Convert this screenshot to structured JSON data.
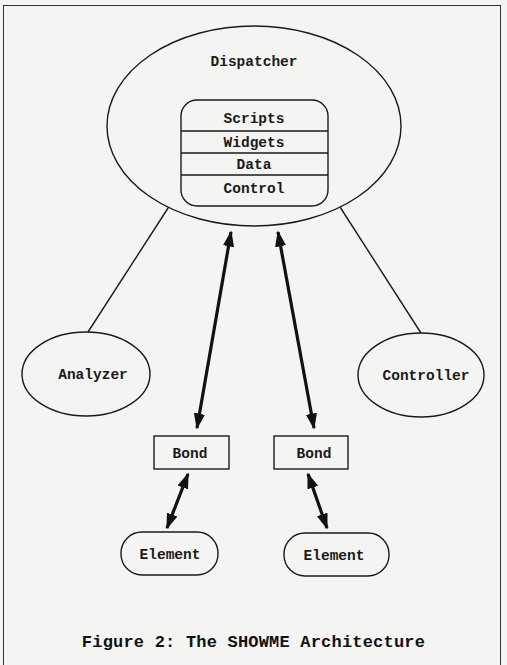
{
  "figure": {
    "caption": "Figure 2: The SHOWME Architecture"
  },
  "nodes": {
    "dispatcher": {
      "label": "Dispatcher",
      "shape": "ellipse"
    },
    "dispatcher_stack": {
      "layers": [
        "Scripts",
        "Widgets",
        "Data",
        "Control"
      ]
    },
    "analyzer": {
      "label": "Analyzer",
      "shape": "ellipse"
    },
    "controller": {
      "label": "Controller",
      "shape": "ellipse"
    },
    "bond_left": {
      "label": "Bond",
      "shape": "rectangle"
    },
    "bond_right": {
      "label": "Bond",
      "shape": "rectangle"
    },
    "element_left": {
      "label": "Element",
      "shape": "rounded-pill"
    },
    "element_right": {
      "label": "Element",
      "shape": "rounded-pill"
    }
  },
  "edges": [
    {
      "from": "dispatcher",
      "to": "analyzer",
      "style": "line"
    },
    {
      "from": "dispatcher",
      "to": "controller",
      "style": "line"
    },
    {
      "from": "dispatcher",
      "to": "bond_left",
      "style": "double-arrow"
    },
    {
      "from": "dispatcher",
      "to": "bond_right",
      "style": "double-arrow"
    },
    {
      "from": "bond_left",
      "to": "element_left",
      "style": "double-arrow"
    },
    {
      "from": "bond_right",
      "to": "element_right",
      "style": "double-arrow"
    }
  ],
  "colors": {
    "background": "#f4f4f2",
    "stroke": "#1a1a1a"
  }
}
